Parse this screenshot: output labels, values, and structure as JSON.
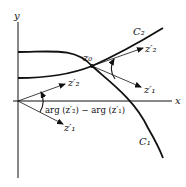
{
  "diagram": {
    "axes": {
      "x_label": "x",
      "y_label": "y"
    },
    "point_label": "z₀",
    "curves": [
      {
        "name": "C₁"
      },
      {
        "name": "C₂"
      }
    ],
    "tangent_labels": {
      "z2_prime": "z′₂",
      "z1_prime": "z′₁"
    },
    "angle_label": "arg (z′₂) − arg (z′₁)"
  }
}
